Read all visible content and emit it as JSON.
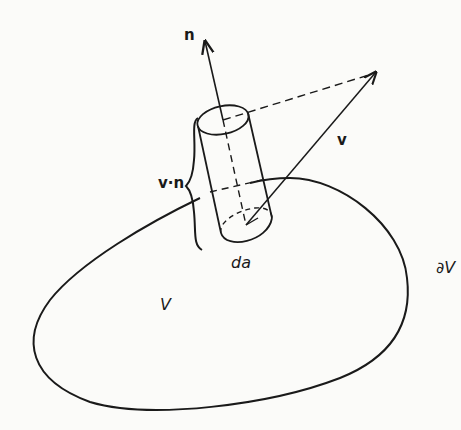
{
  "diagram": {
    "labels": {
      "normal": "n",
      "vector": "v",
      "projection": "v·n",
      "area_element": "da",
      "volume": "V",
      "boundary": "∂V"
    },
    "colors": {
      "line": "#1a1a1a",
      "background": "#fbfbf9"
    }
  }
}
